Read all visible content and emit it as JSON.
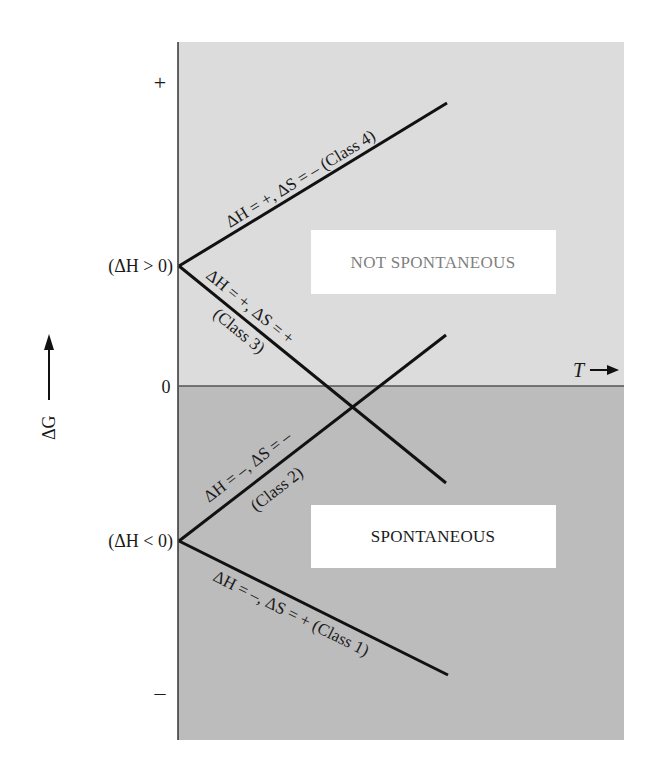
{
  "diagram": {
    "type": "free-energy-vs-temperature",
    "colors": {
      "not_spontaneous_region": "#dcdcdc",
      "spontaneous_region": "#bcbcbc",
      "axis": "#333333",
      "zero_line": "#555555",
      "lines": "#111111",
      "box_fill": "#ffffff",
      "not_spontaneous_text": "#808080",
      "spontaneous_text": "#1a1a1a"
    },
    "y_axis": {
      "label": "ΔG",
      "ticks": {
        "plus": "+",
        "zero": "0",
        "minus": "–"
      },
      "intercepts": {
        "positive": "(ΔH > 0)",
        "negative": "(ΔH < 0)"
      }
    },
    "x_axis": {
      "label": "T"
    },
    "regions": {
      "upper": "NOT SPONTANEOUS",
      "lower": "SPONTANEOUS"
    },
    "lines": [
      {
        "class": "Class 1",
        "label": "ΔH = –, ΔS = + (Class 1)",
        "start": "ΔH<0",
        "slope": "negative"
      },
      {
        "class": "Class 2",
        "label_main": "ΔH = –, ΔS = –",
        "label_sub": "(Class 2)",
        "start": "ΔH<0",
        "slope": "positive"
      },
      {
        "class": "Class 3",
        "label_main": "ΔH = +, ΔS = +",
        "label_sub": "(Class 3)",
        "start": "ΔH>0",
        "slope": "negative"
      },
      {
        "class": "Class 4",
        "label": "ΔH = +, ΔS = –  (Class 4)",
        "start": "ΔH>0",
        "slope": "positive"
      }
    ]
  }
}
